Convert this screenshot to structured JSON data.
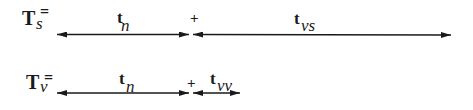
{
  "equations": [
    {
      "lhs": {
        "symbol": "T",
        "subscript": "s",
        "equals": "="
      },
      "terms": [
        {
          "symbol": "t",
          "subscript": "n"
        },
        {
          "operator": "+"
        },
        {
          "symbol": "t",
          "subscript": "vs"
        }
      ]
    },
    {
      "lhs": {
        "symbol": "T",
        "subscript": "v",
        "equals": "="
      },
      "terms": [
        {
          "symbol": "t",
          "subscript": "n"
        },
        {
          "operator": "+"
        },
        {
          "symbol": "t",
          "subscript": "vv"
        }
      ]
    }
  ],
  "colors": {
    "ink": "#1a1a1a",
    "background": "#ffffff"
  }
}
